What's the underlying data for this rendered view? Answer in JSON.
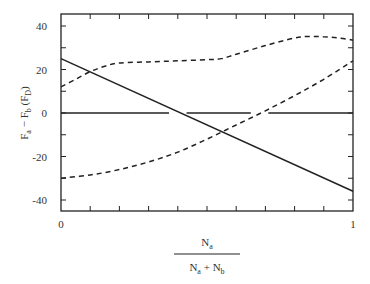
{
  "chart_data": {
    "type": "line",
    "title": "",
    "xlabel": "N_a / (N_a + N_b)",
    "xlabel_numerator": "N",
    "xlabel_numerator_sub": "a",
    "xlabel_denominator": [
      "N",
      "a",
      " + N",
      "b"
    ],
    "ylabel": "F_a - F_b (F_D)",
    "ylabel_parts": [
      "F",
      "a",
      " − F",
      "b",
      " (F",
      "D",
      ")"
    ],
    "xlim": [
      0,
      1
    ],
    "ylim": [
      -45,
      45.5
    ],
    "x_ticks": [
      0,
      1
    ],
    "x_tick_labels": [
      "0",
      "1"
    ],
    "y_ticks": [
      -40,
      -20,
      0,
      20,
      40
    ],
    "y_tick_labels": [
      "-40",
      "-20",
      "0",
      "20",
      "40"
    ],
    "grid": false,
    "legend": null,
    "series": [
      {
        "name": "solid linear",
        "style": "solid",
        "x": [
          0,
          1
        ],
        "y": [
          25,
          -36
        ]
      },
      {
        "name": "upper dashed",
        "style": "dashed",
        "x": [
          0,
          0.05,
          0.1,
          0.15,
          0.2,
          0.3,
          0.4,
          0.5,
          0.55,
          0.6,
          0.7,
          0.8,
          0.85,
          0.9,
          0.95,
          1.0
        ],
        "y": [
          12,
          15.5,
          19,
          21.5,
          23,
          23.5,
          24,
          24.5,
          25,
          27,
          31,
          34.5,
          35.2,
          35,
          34.5,
          33.5
        ]
      },
      {
        "name": "lower dashed",
        "style": "dashed",
        "x": [
          0,
          0.1,
          0.2,
          0.3,
          0.4,
          0.5,
          0.6,
          0.7,
          0.8,
          0.9,
          1.0
        ],
        "y": [
          -30,
          -28.5,
          -26,
          -22.5,
          -18,
          -12,
          -5.5,
          1,
          8,
          15.5,
          24
        ]
      },
      {
        "name": "zero reference (broken)",
        "style": "solid",
        "segments": [
          [
            0,
            0.37
          ],
          [
            0.43,
            0.65
          ],
          [
            0.71,
            1.0
          ]
        ],
        "y": 0
      }
    ]
  }
}
